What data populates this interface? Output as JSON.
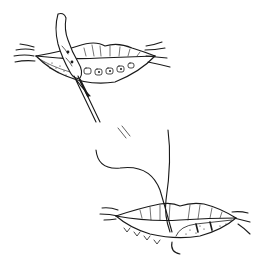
{
  "figure": {
    "colors": {
      "ink": "#1a1a1a",
      "background": "#ffffff"
    },
    "panels": [
      {
        "id": "top",
        "content": "lip with everted mucosal flap and forceps/instrument inserted"
      },
      {
        "id": "bottom",
        "content": "lip with suture thread and closed incision"
      }
    ]
  }
}
